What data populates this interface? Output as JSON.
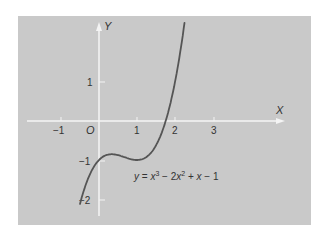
{
  "chart_data": {
    "type": "line",
    "title": "",
    "xlabel": "X",
    "ylabel": "Y",
    "xlim": [
      -1.5,
      4
    ],
    "ylim": [
      -2.5,
      2.6
    ],
    "grid": false,
    "origin_label": "O",
    "x_ticks": [
      -1,
      1,
      2,
      3
    ],
    "x_tick_labels": [
      "−1",
      "1",
      "2",
      "3"
    ],
    "y_ticks": [
      1,
      -1,
      -2
    ],
    "y_tick_labels": [
      "1",
      "−1",
      "−2"
    ],
    "series": [
      {
        "name": "y = x³ − 2x² + x − 1",
        "function": "x^3 - 2x^2 + x - 1",
        "x_range": [
          -0.5,
          2.25
        ],
        "x": [
          -0.5,
          -0.25,
          0,
          0.25,
          0.333,
          0.5,
          0.75,
          1,
          1.25,
          1.5,
          1.75,
          2,
          2.25
        ],
        "values": [
          -2.125,
          -1.328,
          -1.0,
          -0.859,
          -0.852,
          -0.875,
          -0.953,
          -1.0,
          -0.922,
          -0.625,
          -0.016,
          1.0,
          2.516
        ]
      }
    ],
    "annotation": {
      "text": "y = x³ − 2x² + x − 1",
      "position": "lower-right of curve"
    },
    "colors": {
      "panel": "#c9c9c9",
      "axes": "#f4f4f4",
      "curve": "#555555",
      "text": "#333333"
    }
  },
  "labels": {
    "x_axis": "X",
    "y_axis": "Y",
    "origin": "O",
    "xt_m1": "−1",
    "xt_1": "1",
    "xt_2": "2",
    "xt_3": "3",
    "yt_1": "1",
    "yt_m1": "−1",
    "yt_m2": "−2",
    "eq_y": "y",
    "eq_eq": " = ",
    "eq_x1": "x",
    "eq_exp3": "3",
    "eq_minus2": " − 2",
    "eq_x2": "x",
    "eq_exp2": "2",
    "eq_plus": " + ",
    "eq_x3": "x",
    "eq_minus1": " − 1"
  }
}
